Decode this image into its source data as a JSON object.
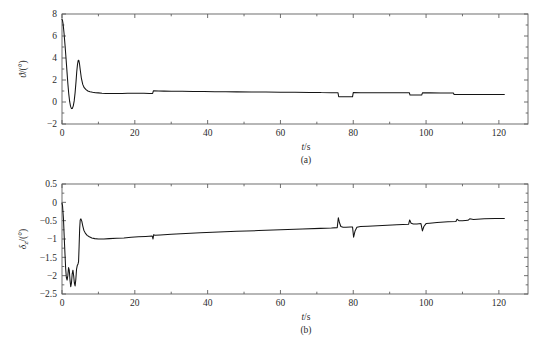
{
  "figure": {
    "background_color": "#ffffff",
    "line_color": "#141414",
    "axis_color": "#5f5f5f"
  },
  "chart_data": [
    {
      "type": "line",
      "panel_id": "a",
      "caption": "(a)",
      "title": "",
      "xlabel": "t/s",
      "ylabel": "ϑ/(°)",
      "ylabel_symbol": "ϑ",
      "ylabel_unit": "/(°)",
      "xlim": [
        0,
        128
      ],
      "ylim": [
        -2,
        8
      ],
      "xticks": [
        0,
        20,
        40,
        60,
        80,
        100,
        120
      ],
      "xticklabels": [
        "0",
        "20",
        "40",
        "60",
        "80",
        "100",
        "120"
      ],
      "yticks": [
        -2,
        0,
        2,
        4,
        6,
        8
      ],
      "yticklabels": [
        "-2",
        "0",
        "2",
        "4",
        "6",
        "8"
      ],
      "grid": false,
      "legend": null,
      "series": [
        {
          "name": "pitch-angle",
          "color": "#141414",
          "x": [
            0,
            0.12,
            0.3,
            0.55,
            0.85,
            1.1,
            1.35,
            1.6,
            1.85,
            2.1,
            2.35,
            2.6,
            2.85,
            3.1,
            3.35,
            3.6,
            3.85,
            4.05,
            4.25,
            4.45,
            4.6,
            4.8,
            5.0,
            5.3,
            5.7,
            6.1,
            6.6,
            7.1,
            7.7,
            8.4,
            9.2,
            10.0,
            11.0,
            12.0,
            13.5,
            15.0,
            16.5,
            18.0,
            19.5,
            21.0,
            22.5,
            24.0,
            24.9,
            25.1,
            26.5,
            28.0,
            30.0,
            33.0,
            36.0,
            39.0,
            42.0,
            45.0,
            48.0,
            52.0,
            56.0,
            60.0,
            64.0,
            68.0,
            71.0,
            71.2,
            74.0,
            75.8,
            76.0,
            78.0,
            79.8,
            80.0,
            82.0,
            86.0,
            90.0,
            93.0,
            95.4,
            95.6,
            97.0,
            98.8,
            99.0,
            101.0,
            104.0,
            107.5,
            107.7,
            110.0,
            114.0,
            118.0,
            121.5
          ],
          "y": [
            7.5,
            7.45,
            7.1,
            6.3,
            5.1,
            4.0,
            2.85,
            1.7,
            0.75,
            0.05,
            -0.4,
            -0.6,
            -0.58,
            -0.35,
            0.1,
            0.85,
            1.85,
            2.75,
            3.4,
            3.78,
            3.8,
            3.5,
            2.95,
            2.2,
            1.6,
            1.3,
            1.12,
            1.0,
            0.93,
            0.88,
            0.85,
            0.83,
            0.8,
            0.78,
            0.77,
            0.77,
            0.78,
            0.79,
            0.8,
            0.8,
            0.79,
            0.78,
            0.78,
            1.02,
            1.0,
            0.99,
            0.98,
            0.97,
            0.96,
            0.95,
            0.94,
            0.93,
            0.92,
            0.91,
            0.9,
            0.89,
            0.88,
            0.87,
            0.87,
            0.86,
            0.85,
            0.85,
            0.48,
            0.47,
            0.47,
            0.86,
            0.85,
            0.85,
            0.84,
            0.84,
            0.84,
            0.63,
            0.63,
            0.63,
            0.83,
            0.83,
            0.82,
            0.82,
            0.68,
            0.68,
            0.68,
            0.68,
            0.68
          ],
          "features": [
            {
              "label": "initial-peak",
              "t": 0.0,
              "value": 7.5
            },
            {
              "label": "undershoot",
              "t": 2.6,
              "value": -0.6
            },
            {
              "label": "second-peak",
              "t": 4.5,
              "value": 3.8
            },
            {
              "label": "step-up",
              "t": 25.0,
              "value": 1.02
            },
            {
              "label": "notch-down-1",
              "t": 76.0,
              "value": 0.47
            },
            {
              "label": "notch-recover-1",
              "t": 80.0,
              "value": 0.86
            },
            {
              "label": "notch-down-2",
              "t": 95.5,
              "value": 0.63
            },
            {
              "label": "notch-recover-2",
              "t": 99.0,
              "value": 0.83
            },
            {
              "label": "final-step",
              "t": 107.6,
              "value": 0.68
            }
          ]
        }
      ]
    },
    {
      "type": "line",
      "panel_id": "b",
      "caption": "(b)",
      "title": "",
      "xlabel": "t/s",
      "ylabel": "δz/(°)",
      "ylabel_symbol": "δ",
      "ylabel_subscript": "z",
      "ylabel_unit": "/(°)",
      "xlim": [
        0,
        128
      ],
      "ylim": [
        -2.5,
        0.5
      ],
      "xticks": [
        0,
        20,
        40,
        60,
        80,
        100,
        120
      ],
      "xticklabels": [
        "0",
        "20",
        "40",
        "60",
        "80",
        "100",
        "120"
      ],
      "yticks": [
        -2.5,
        -2,
        -1.5,
        -1,
        -0.5,
        0,
        0.5
      ],
      "yticklabels": [
        "-2.5",
        "-2",
        "-1.5",
        "-1",
        "-0.5",
        "0",
        "0.5"
      ],
      "grid": false,
      "legend": null,
      "series": [
        {
          "name": "elevator-deflection",
          "color": "#141414",
          "x": [
            0,
            0.15,
            0.4,
            0.7,
            1.0,
            1.2,
            1.4,
            1.6,
            1.8,
            2.0,
            2.2,
            2.4,
            2.6,
            2.8,
            3.0,
            3.2,
            3.4,
            3.6,
            3.8,
            4.0,
            4.2,
            4.4,
            4.55,
            4.7,
            4.85,
            5.0,
            5.2,
            5.45,
            5.7,
            6.0,
            6.4,
            6.9,
            7.5,
            8.2,
            9.0,
            10.0,
            11.5,
            13.0,
            15.0,
            17.0,
            19.0,
            21.0,
            23.0,
            24.8,
            25.0,
            25.2,
            25.5,
            27.0,
            30.0,
            34.0,
            38.0,
            43.0,
            48.0,
            54.0,
            60.0,
            66.0,
            71.0,
            74.0,
            75.6,
            75.9,
            76.2,
            76.6,
            77.2,
            78.0,
            79.2,
            79.8,
            80.1,
            80.5,
            81.0,
            82.0,
            84.0,
            88.0,
            92.0,
            95.2,
            95.5,
            95.9,
            96.5,
            97.5,
            98.6,
            99.0,
            99.4,
            100.0,
            101.0,
            103.0,
            106.0,
            108.2,
            108.5,
            109.0,
            110.0,
            111.5,
            112.0,
            113.0,
            116.0,
            119.0,
            121.5
          ],
          "y": [
            -0.02,
            -0.1,
            -0.45,
            -1.15,
            -1.8,
            -2.05,
            -2.12,
            -2.0,
            -1.78,
            -1.85,
            -2.12,
            -2.3,
            -2.2,
            -1.95,
            -1.85,
            -2.0,
            -2.2,
            -2.28,
            -2.1,
            -1.82,
            -1.72,
            -1.68,
            -1.62,
            -1.2,
            -0.72,
            -0.48,
            -0.45,
            -0.52,
            -0.64,
            -0.76,
            -0.84,
            -0.9,
            -0.94,
            -0.97,
            -0.99,
            -1.0,
            -1.0,
            -0.99,
            -0.98,
            -0.97,
            -0.95,
            -0.94,
            -0.93,
            -0.92,
            -1.0,
            -0.88,
            -0.9,
            -0.89,
            -0.87,
            -0.85,
            -0.83,
            -0.81,
            -0.79,
            -0.77,
            -0.75,
            -0.73,
            -0.71,
            -0.7,
            -0.69,
            -0.42,
            -0.55,
            -0.66,
            -0.68,
            -0.68,
            -0.67,
            -0.67,
            -0.95,
            -0.78,
            -0.68,
            -0.66,
            -0.65,
            -0.63,
            -0.61,
            -0.6,
            -0.48,
            -0.57,
            -0.59,
            -0.59,
            -0.58,
            -0.78,
            -0.66,
            -0.58,
            -0.57,
            -0.55,
            -0.53,
            -0.52,
            -0.46,
            -0.5,
            -0.5,
            -0.49,
            -0.45,
            -0.47,
            -0.45,
            -0.44,
            -0.44
          ],
          "features": [
            {
              "label": "first-trough",
              "t": 1.4,
              "value": -2.12
            },
            {
              "label": "second-trough",
              "t": 2.4,
              "value": -2.3
            },
            {
              "label": "third-trough",
              "t": 3.6,
              "value": -2.28
            },
            {
              "label": "rise-to-peak",
              "t": 5.2,
              "value": -0.45
            },
            {
              "label": "settle",
              "t": 10.0,
              "value": -1.0
            },
            {
              "label": "spike-25s",
              "t": 25.0,
              "value": -1.0
            },
            {
              "label": "spike-up-76s",
              "t": 75.9,
              "value": -0.42
            },
            {
              "label": "spike-down-80s",
              "t": 80.1,
              "value": -0.95
            },
            {
              "label": "spike-up-95s",
              "t": 95.5,
              "value": -0.48
            },
            {
              "label": "spike-down-99s",
              "t": 99.0,
              "value": -0.78
            },
            {
              "label": "final-value",
              "t": 121.5,
              "value": -0.44
            }
          ]
        }
      ]
    }
  ]
}
